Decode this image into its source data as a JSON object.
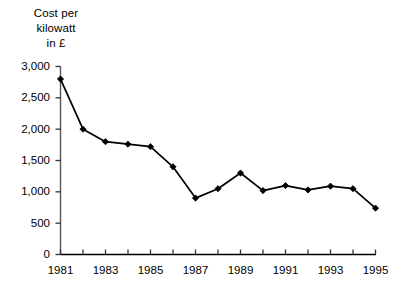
{
  "chart_data": {
    "type": "line",
    "title": "Cost per\nkilowatt\nin £",
    "xlabel": "",
    "ylabel": "Cost per kilowatt in £",
    "x": [
      1981,
      1982,
      1983,
      1984,
      1985,
      1986,
      1987,
      1988,
      1989,
      1990,
      1991,
      1992,
      1993,
      1994,
      1995
    ],
    "values": [
      2800,
      2000,
      1800,
      1760,
      1720,
      1400,
      900,
      1050,
      1300,
      1020,
      1100,
      1030,
      1090,
      1050,
      740
    ],
    "x_tick_labels": [
      "1981",
      "",
      "1983",
      "",
      "1985",
      "",
      "1987",
      "",
      "1989",
      "",
      "1991",
      "",
      "1993",
      "",
      "1995"
    ],
    "y_ticks": [
      0,
      500,
      1000,
      1500,
      2000,
      2500,
      3000
    ],
    "y_tick_labels": [
      "0",
      "500",
      "1,000",
      "1,500",
      "2,000",
      "2,500",
      "3,000"
    ],
    "ylim": [
      0,
      3000
    ],
    "xlim": [
      1981,
      1995
    ],
    "grid": false,
    "legend": null,
    "marker": "filled-diamond",
    "line_color": "#000000",
    "marker_color": "#000000",
    "axis_color": "#000000"
  },
  "caption": ""
}
